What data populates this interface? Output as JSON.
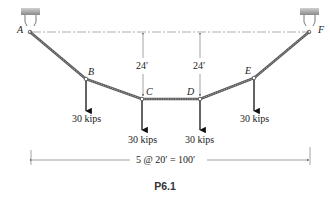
{
  "figure": {
    "caption": "P6.1"
  },
  "nodes": [
    {
      "id": "A",
      "label": "A"
    },
    {
      "id": "B",
      "label": "B"
    },
    {
      "id": "C",
      "label": "C"
    },
    {
      "id": "D",
      "label": "D"
    },
    {
      "id": "E",
      "label": "E"
    },
    {
      "id": "F",
      "label": "F"
    }
  ],
  "loads": [
    {
      "node": "B",
      "label": "30 kips"
    },
    {
      "node": "C",
      "label": "30 kips"
    },
    {
      "node": "D",
      "label": "30 kips"
    },
    {
      "node": "E",
      "label": "30 kips"
    }
  ],
  "dimensions": {
    "sag_c": "24′",
    "sag_d": "24′",
    "span": "5 @ 20′ = 100′"
  },
  "colors": {
    "cable": "#5a5a5a",
    "support": "#9a9a9a",
    "line": "#333333"
  }
}
